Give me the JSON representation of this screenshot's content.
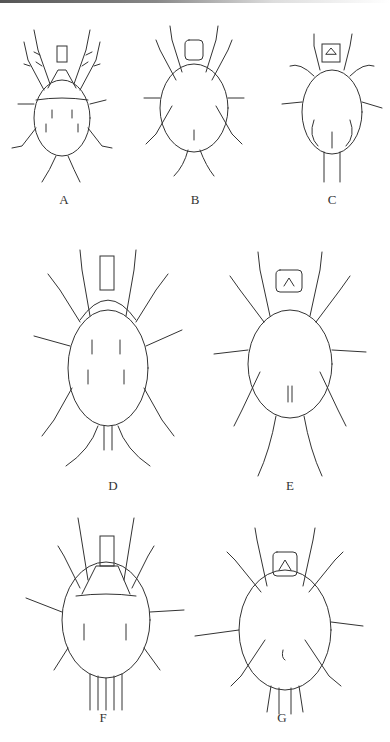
{
  "figure": {
    "panels": [
      {
        "id": "A",
        "label": "A",
        "view": "dorsal"
      },
      {
        "id": "B",
        "label": "B",
        "view": "ventral"
      },
      {
        "id": "C",
        "label": "C",
        "view": "ventral"
      },
      {
        "id": "D",
        "label": "D",
        "view": "dorsal"
      },
      {
        "id": "E",
        "label": "E",
        "view": "ventral"
      },
      {
        "id": "F",
        "label": "F",
        "view": "dorsal"
      },
      {
        "id": "G",
        "label": "G",
        "view": "ventral"
      }
    ]
  }
}
